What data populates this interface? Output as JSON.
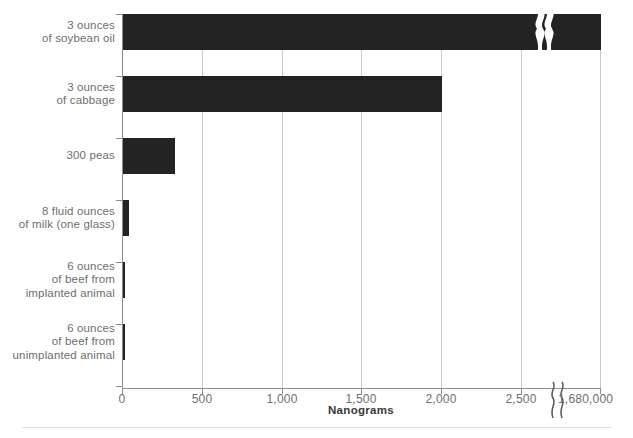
{
  "figure": {
    "clipped_top_text": "",
    "clipped_bottom_text": ""
  },
  "chart_data": {
    "type": "bar",
    "orientation": "horizontal",
    "title": "",
    "subtitle": "",
    "xlabel": "Nanograms",
    "ylabel": "",
    "grid": true,
    "legend": false,
    "axis_break": {
      "present": true,
      "between": [
        2500,
        1680000
      ],
      "symbol": "}}",
      "note": "x-axis is broken between 2,500 and 1,680,000 nanograms"
    },
    "xlim": [
      0,
      2750
    ],
    "xticks": [
      0,
      500,
      1000,
      1500,
      2000,
      2500,
      2750
    ],
    "xtick_labels": [
      "0",
      "500",
      "1,000",
      "1,500",
      "2,000",
      "2,500",
      "1,680,000"
    ],
    "categories": [
      "3 ounces\nof soybean oil",
      "3 ounces\nof cabbage",
      "300 peas",
      "8 fluid ounces\nof milk (one glass)",
      "6 ounces\nof beef from\nimplanted animal",
      "6 ounces\nof beef from\nunimplanted animal"
    ],
    "values": [
      1680000,
      2000,
      340,
      32,
      1.5,
      0.5
    ],
    "value_labels": [
      "1,680,000",
      "2,000",
      "340",
      "32",
      "1.5",
      "0.5"
    ],
    "bar_color": "#232323",
    "axis_color": "#8e8e8e",
    "grid_color": "#c9c9c9",
    "label_color": "#6e6e6e"
  },
  "bars": [
    {
      "label_line1": "3 ounces",
      "label_line2": "of soybean oil",
      "label_line3": "",
      "value": 1680000,
      "pixel_width": 478,
      "top": 14,
      "broken": true
    },
    {
      "label_line1": "3 ounces",
      "label_line2": "of cabbage",
      "label_line3": "",
      "value": 2000,
      "pixel_width": 319,
      "top": 76,
      "broken": false
    },
    {
      "label_line1": "300 peas",
      "label_line2": "",
      "label_line3": "",
      "value": 340,
      "pixel_width": 52,
      "top": 138,
      "broken": false
    },
    {
      "label_line1": "8 fluid ounces",
      "label_line2": "of milk (one glass)",
      "label_line3": "",
      "value": 32,
      "pixel_width": 6,
      "top": 200,
      "broken": false
    },
    {
      "label_line1": "6 ounces",
      "label_line2": "of beef from",
      "label_line3": "implanted animal",
      "value": 1.5,
      "pixel_width": 2,
      "top": 262,
      "broken": false
    },
    {
      "label_line1": "6 ounces",
      "label_line2": "of beef from",
      "label_line3": "unimplanted animal",
      "value": 0.5,
      "pixel_width": 2,
      "top": 324,
      "broken": false
    }
  ],
  "gridlines": [
    {
      "label": "500",
      "x": 80
    },
    {
      "label": "1,000",
      "x": 160
    },
    {
      "label": "1,500",
      "x": 239
    },
    {
      "label": "2,000",
      "x": 319
    },
    {
      "label": "2,500",
      "x": 399
    },
    {
      "label": "1,680,000",
      "x": 478
    }
  ],
  "xtick_zero": {
    "label": "0",
    "x": 0
  }
}
